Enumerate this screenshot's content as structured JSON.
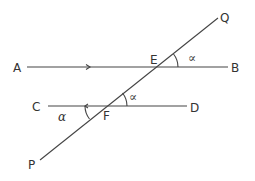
{
  "diagram": {
    "type": "geometry-parallel-lines-transversal",
    "points": {
      "A": "A",
      "B": "B",
      "C": "C",
      "D": "D",
      "E": "E",
      "F": "F",
      "P": "P",
      "Q": "Q"
    },
    "angle_labels": {
      "at_E": "∝",
      "at_F_upper": "∝",
      "at_F_lower": "α"
    },
    "lines": [
      "AB",
      "CD",
      "PQ"
    ],
    "colors": {
      "stroke": "#444444",
      "background": "#ffffff"
    }
  }
}
